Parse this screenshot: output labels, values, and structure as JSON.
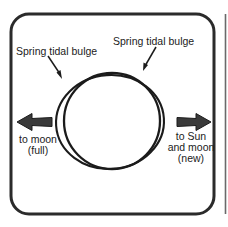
{
  "figure": {
    "name": "spring-tide-diagram",
    "panel": {
      "border_color": "#2b2b2b",
      "background_color": "#ffffff",
      "corner_radius": 18
    },
    "stroke_color": "#1b1b1b",
    "labels": {
      "bulge_left": "Spring tidal bulge",
      "bulge_right": "Spring tidal bulge",
      "to_moon_line1": "to moon",
      "to_moon_line2": "(full)",
      "to_sun_line1": "to Sun",
      "to_sun_line2": "and moon",
      "to_sun_line3": "(new)"
    },
    "shapes": {
      "earth_circle": {
        "name": "earth-circle",
        "cx": 112,
        "cy": 121,
        "r": 48
      },
      "tidal_bulge_ellipse": {
        "name": "tidal-bulge-ellipse",
        "cx": 110,
        "cy": 122,
        "rx": 54,
        "ry": 47,
        "rotation": -4
      }
    },
    "arrows": {
      "to_moon_arrow": {
        "name": "to-moon-arrow",
        "direction": "left",
        "x_start": 52,
        "x_end": 17,
        "y": 122
      },
      "to_sun_arrow": {
        "name": "to-sun-arrow",
        "direction": "right",
        "x_start": 176,
        "x_end": 211,
        "y": 122
      },
      "leader_left": {
        "name": "leader-arrow-left",
        "x1": 49,
        "y1": 57,
        "x2": 62,
        "y2": 78
      },
      "leader_right": {
        "name": "leader-arrow-right",
        "x1": 155,
        "y1": 48,
        "x2": 143,
        "y2": 70
      }
    },
    "divider": {
      "name": "panel-divider",
      "x": 224
    }
  }
}
